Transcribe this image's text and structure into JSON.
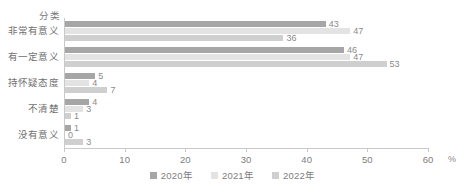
{
  "chart_data": {
    "type": "bar",
    "orientation": "horizontal",
    "title": "",
    "xlabel": "%",
    "ylabel": "分类",
    "xlim": [
      0,
      60
    ],
    "xticks": [
      0,
      10,
      20,
      30,
      40,
      50,
      60
    ],
    "xtick_labels": [
      "0",
      "10",
      "20",
      "30",
      "40",
      "50",
      "60"
    ],
    "grid": false,
    "legend_position": "bottom-center",
    "categories": [
      "非常有意义",
      "有一定意义",
      "持怀疑态度",
      "不清楚",
      "没有意义"
    ],
    "series": [
      {
        "name": "2020年",
        "color": "#a6a6a6",
        "values": [
          43,
          46,
          5,
          4,
          1
        ]
      },
      {
        "name": "2021年",
        "color": "#e3e3e3",
        "values": [
          47,
          47,
          4,
          3,
          0
        ]
      },
      {
        "name": "2022年",
        "color": "#cfcfcf",
        "values": [
          36,
          53,
          7,
          1,
          3
        ]
      }
    ]
  },
  "axis": {
    "y_title": "分类",
    "unit": "%"
  },
  "legend": {
    "items": [
      {
        "label": "2020年",
        "color": "#a6a6a6"
      },
      {
        "label": "2021年",
        "color": "#e3e3e3"
      },
      {
        "label": "2022年",
        "color": "#cfcfcf"
      }
    ]
  }
}
